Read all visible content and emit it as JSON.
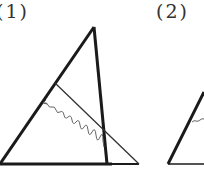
{
  "figures": [
    {
      "label": "(1)",
      "description": "Triangle with bold altitude-like segment from apex to base, a thin line parallel construction, and a wavy line indicating a perpendicular segment"
    },
    {
      "label": "(2)",
      "description": "Second triangle, partially visible, with a short wavy marker on its left side"
    }
  ],
  "colors": {
    "stroke": "#1a1a1a",
    "thin": "#333333",
    "wavy": "#555555"
  }
}
